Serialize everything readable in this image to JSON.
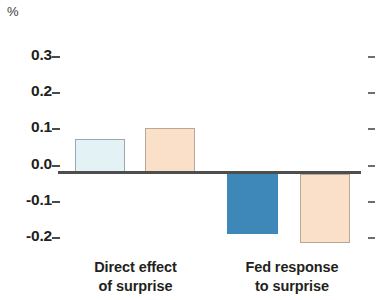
{
  "chart_data": {
    "type": "bar",
    "title": "",
    "subtitle": "",
    "unit_label": "%",
    "xlabel": "",
    "ylabel": "",
    "ylim": [
      -0.2,
      0.3
    ],
    "grid": false,
    "legend_position": "none",
    "ytick_labels": [
      "0.3",
      "0.2",
      "0.1",
      "0.0",
      "-0.1",
      "-0.2"
    ],
    "ytick_values": [
      0.3,
      0.2,
      0.1,
      0.0,
      -0.1,
      -0.2
    ],
    "categories": [
      "Direct effect of surprise",
      "Fed response to surprise"
    ],
    "category_lines": [
      [
        "Direct effect",
        "of surprise"
      ],
      [
        "Fed response",
        "to surprise"
      ]
    ],
    "series": [
      {
        "name": "series-1",
        "color": "#e2f2f5",
        "values": [
          0.09,
          -0.165
        ]
      },
      {
        "name": "series-2",
        "color": "#fae0c8",
        "values": [
          0.12,
          -0.19
        ]
      }
    ],
    "bars": [
      {
        "id": "bar-direct-1",
        "group": "Direct effect of surprise",
        "value": 0.09,
        "fill": "#e2f2f5",
        "stroke": "#9aa7ac"
      },
      {
        "id": "bar-direct-2",
        "group": "Direct effect of surprise",
        "value": 0.12,
        "fill": "#fae0c8",
        "stroke": "#b9a797"
      },
      {
        "id": "bar-fed-1",
        "group": "Fed response to surprise",
        "value": -0.165,
        "fill": "#3d88b8",
        "stroke": "#3d88b8"
      },
      {
        "id": "bar-fed-2",
        "group": "Fed response to surprise",
        "value": -0.19,
        "fill": "#fae0c8",
        "stroke": "#b9a797"
      }
    ],
    "colors": {
      "light_blue": "#e2f2f5",
      "dark_blue": "#3d88b8",
      "peach": "#fae0c8",
      "axis": "#4e4e4e",
      "text": "#231f20"
    }
  }
}
